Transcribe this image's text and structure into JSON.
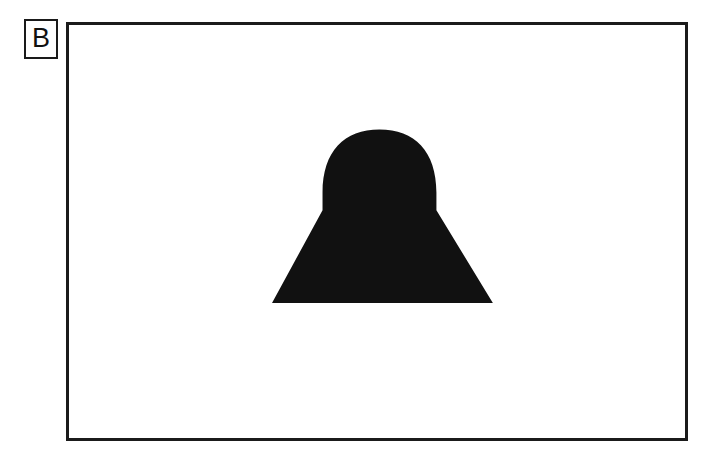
{
  "page": {
    "background_color": "#ffffff",
    "width": 717,
    "height": 449
  },
  "panel_label": {
    "text": "B",
    "border_color": "#1a1a1a",
    "text_color": "#111111"
  },
  "stimulus_frame": {
    "border_color": "#1b1b1b",
    "border_width_px": 3,
    "fill_color": "#ffffff",
    "left": 66,
    "top": 22,
    "width": 622,
    "height": 419
  },
  "figure": {
    "name": "bell-silhouette",
    "fill_color": "#111111",
    "geometry": {
      "viewbox": "0 0 622 419",
      "dome_top_y": 106,
      "dome_left_x": 256,
      "dome_right_x": 371,
      "shoulder_y": 188,
      "base_left_x": 205,
      "base_right_x": 428,
      "base_y": 282
    },
    "path": "M 205 282 L 256 188 L 256 170 C 256 128 278 106 313.5 106 C 349 106 371 128 371 170 L 371 188 L 428 282 Z"
  }
}
